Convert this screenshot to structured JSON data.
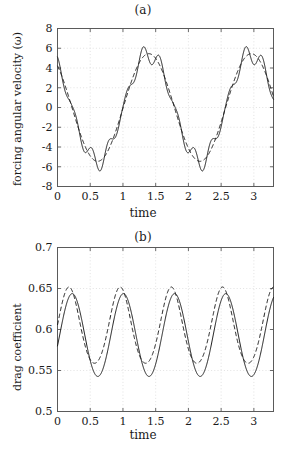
{
  "figure": {
    "panels": [
      {
        "id": "a",
        "title": "(a)",
        "xlabel": "time",
        "ylabel": "forcing angular velocity (ω)"
      },
      {
        "id": "b",
        "title": "(b)",
        "xlabel": "time",
        "ylabel": "drag coefficient"
      }
    ]
  },
  "chart_data": [
    {
      "type": "line",
      "panel": "(a)",
      "title": "(a)",
      "xlabel": "time",
      "ylabel": "forcing angular velocity (ω)",
      "xlim": [
        0,
        3.3
      ],
      "ylim": [
        -8,
        8
      ],
      "xticks": [
        0,
        0.5,
        1,
        1.5,
        2,
        2.5,
        3
      ],
      "xticklabels": [
        "0",
        "0.5",
        "1",
        "1.5",
        "2",
        "2.5",
        "3"
      ],
      "yticks": [
        -8,
        -6,
        -4,
        -2,
        0,
        2,
        4,
        6,
        8
      ],
      "yticklabels": [
        "-8",
        "-6",
        "-4",
        "-2",
        "0",
        "2",
        "4",
        "6",
        "8"
      ],
      "grid": true,
      "legend": null,
      "series": [
        {
          "name": "computed (solid)",
          "style": "solid",
          "color": "#1a1a1a",
          "model": "smooth_plus_ripple",
          "base_amplitude": 5.45,
          "base_period": 1.565,
          "base_phase_offset": -0.17,
          "ripple_amplitude": 1.05,
          "ripple_period": 0.261,
          "ripple_phase_offset": 0.0
        },
        {
          "name": "reference (dashed)",
          "style": "dashed",
          "color": "#1a1a1a",
          "model": "sinusoid",
          "base_amplitude": 5.45,
          "base_period": 1.565,
          "base_phase_offset": -0.17
        }
      ],
      "notes": {
        "solid_peak_values": [
          6.1,
          6.2,
          6.1
        ],
        "solid_trough_values": [
          -6.3,
          -6.3
        ],
        "dashed_peak_values": [
          5.5,
          5.5,
          5.5
        ],
        "dashed_trough_values": [
          -5.5,
          -5.5
        ],
        "start_value_solid": 5.1,
        "start_value_dashed": 4.1
      }
    },
    {
      "type": "line",
      "panel": "(b)",
      "title": "(b)",
      "xlabel": "time",
      "ylabel": "drag coefficient",
      "xlim": [
        0,
        3.3
      ],
      "ylim": [
        0.5,
        0.7
      ],
      "xticks": [
        0,
        0.5,
        1,
        1.5,
        2,
        2.5,
        3
      ],
      "xticklabels": [
        "0",
        "0.5",
        "1",
        "1.5",
        "2",
        "2.5",
        "3"
      ],
      "yticks": [
        0.5,
        0.55,
        0.6,
        0.65,
        0.7
      ],
      "yticklabels": [
        "0.5",
        "0.55",
        "0.6",
        "0.65",
        "0.7"
      ],
      "grid": true,
      "legend": null,
      "series": [
        {
          "name": "computed (solid)",
          "style": "solid",
          "color": "#1a1a1a",
          "model": "sinusoid",
          "mean": 0.5925,
          "amplitude": 0.0505,
          "period": 0.782,
          "phase_offset": 0.225,
          "peak_values": [
            0.643,
            0.641,
            0.643,
            0.642
          ],
          "peak_times": [
            0.23,
            1.01,
            1.79,
            2.57
          ],
          "trough_values": [
            0.542,
            0.541,
            0.541,
            0.542
          ],
          "trough_times": [
            0.62,
            1.4,
            2.18,
            2.96
          ],
          "start_value": 0.607
        },
        {
          "name": "reference (dashed)",
          "style": "dashed",
          "color": "#1a1a1a",
          "model": "sinusoid_asymmetric",
          "mean": 0.6015,
          "amplitude": 0.0465,
          "period": 0.782,
          "phase_offset": 0.175,
          "peak_values": [
            0.648,
            0.647,
            0.648,
            0.647
          ],
          "peak_times": [
            0.28,
            1.06,
            1.84,
            2.62
          ],
          "trough_values": [
            0.556,
            0.555,
            0.556,
            0.556
          ],
          "trough_times": [
            0.67,
            1.45,
            2.23,
            3.01
          ],
          "start_value": 0.612
        }
      ]
    }
  ]
}
